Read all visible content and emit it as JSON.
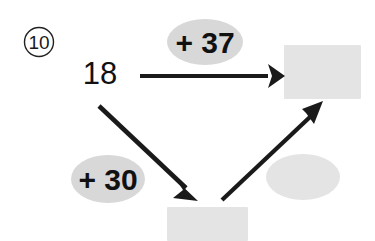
{
  "worksheet": {
    "question_number": "10",
    "start_value": "18",
    "operations": [
      {
        "label": "+ 37"
      },
      {
        "label": "+ 30"
      }
    ],
    "answer_blanks": [
      {
        "shape": "rectangle",
        "value": ""
      },
      {
        "shape": "rectangle",
        "value": ""
      },
      {
        "shape": "ellipse",
        "value": ""
      }
    ],
    "colors": {
      "ink": "#111111",
      "blank_fill": "#e4e4e4",
      "label_fill": "#d8d8d8",
      "page_background": "#ffffff"
    }
  }
}
